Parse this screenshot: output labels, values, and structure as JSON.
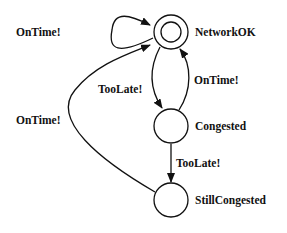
{
  "diagram": {
    "type": "state-machine",
    "nodes": [
      {
        "id": "networkok",
        "label": "NetworkOK",
        "accepting": true
      },
      {
        "id": "congested",
        "label": "Congested",
        "accepting": false
      },
      {
        "id": "stillcongested",
        "label": "StillCongested",
        "accepting": false
      }
    ],
    "edges": [
      {
        "from": "networkok",
        "to": "networkok",
        "label": "OnTime!"
      },
      {
        "from": "networkok",
        "to": "congested",
        "label": "TooLate!"
      },
      {
        "from": "congested",
        "to": "networkok",
        "label": "OnTime!"
      },
      {
        "from": "congested",
        "to": "stillcongested",
        "label": "TooLate!"
      },
      {
        "from": "stillcongested",
        "to": "networkok",
        "label": "OnTime!"
      }
    ]
  }
}
